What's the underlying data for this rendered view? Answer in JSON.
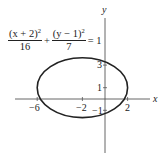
{
  "equation": {
    "term1": {
      "numerator": "(x + 2)",
      "exponent": "2",
      "denominator": "16"
    },
    "plus": "+",
    "term2": {
      "numerator": "(y − 1)",
      "exponent": "2",
      "denominator": "7"
    },
    "rhs": "= 1"
  },
  "axes": {
    "x_label": "x",
    "y_label": "y",
    "x_ticks": [
      {
        "value": -6,
        "label": "−6"
      },
      {
        "value": -2,
        "label": "−2"
      },
      {
        "value": 2,
        "label": "2"
      }
    ],
    "y_ticks": [
      {
        "value": 3,
        "label": "3"
      },
      {
        "value": 1,
        "label": "1"
      },
      {
        "value": -1,
        "label": "−1"
      }
    ]
  },
  "ellipse": {
    "center": [
      -2,
      1
    ],
    "semi_major_x": 4,
    "semi_minor_y": 2.6458,
    "stroke": "#222222"
  },
  "labels": {
    "x_tick_neg6": "−6",
    "x_tick_neg2": "−2",
    "x_tick_2": "2",
    "y_tick_3": "3",
    "y_tick_1": "1",
    "y_tick_neg1": "−1"
  }
}
